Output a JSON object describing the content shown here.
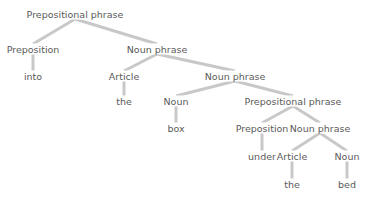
{
  "diagram": {
    "type": "parse-tree",
    "edge_color": "#c8c8c8",
    "text_color": "#5a5a5a",
    "nodes": [
      {
        "id": "pp1",
        "label": "Prepositional phrase",
        "x": 75,
        "y": 14,
        "kind": "phrase"
      },
      {
        "id": "prep1",
        "label": "Preposition",
        "x": 33,
        "y": 49,
        "kind": "category"
      },
      {
        "id": "into",
        "label": "into",
        "x": 33,
        "y": 76,
        "kind": "word"
      },
      {
        "id": "np1",
        "label": "Noun phrase",
        "x": 157,
        "y": 49,
        "kind": "phrase"
      },
      {
        "id": "art1",
        "label": "Article",
        "x": 124,
        "y": 76,
        "kind": "category"
      },
      {
        "id": "the1",
        "label": "the",
        "x": 124,
        "y": 101,
        "kind": "word"
      },
      {
        "id": "np2",
        "label": "Noun phrase",
        "x": 235,
        "y": 76,
        "kind": "phrase"
      },
      {
        "id": "noun1",
        "label": "Noun",
        "x": 176,
        "y": 101,
        "kind": "category"
      },
      {
        "id": "box",
        "label": "box",
        "x": 176,
        "y": 128,
        "kind": "word"
      },
      {
        "id": "pp2",
        "label": "Prepositional phrase",
        "x": 293,
        "y": 101,
        "kind": "phrase"
      },
      {
        "id": "prep2",
        "label": "Preposition",
        "x": 262,
        "y": 128,
        "kind": "category"
      },
      {
        "id": "under",
        "label": "under",
        "x": 262,
        "y": 156,
        "kind": "word"
      },
      {
        "id": "np3",
        "label": "Noun phrase",
        "x": 320,
        "y": 128,
        "kind": "phrase"
      },
      {
        "id": "art2",
        "label": "Article",
        "x": 292,
        "y": 156,
        "kind": "category"
      },
      {
        "id": "the2",
        "label": "the",
        "x": 292,
        "y": 184,
        "kind": "word"
      },
      {
        "id": "noun2",
        "label": "Noun",
        "x": 347,
        "y": 156,
        "kind": "category"
      },
      {
        "id": "bed",
        "label": "bed",
        "x": 347,
        "y": 184,
        "kind": "word"
      }
    ],
    "edges": [
      [
        "pp1",
        "prep1"
      ],
      [
        "pp1",
        "np1"
      ],
      [
        "prep1",
        "into"
      ],
      [
        "np1",
        "art1"
      ],
      [
        "np1",
        "np2"
      ],
      [
        "art1",
        "the1"
      ],
      [
        "np2",
        "noun1"
      ],
      [
        "np2",
        "pp2"
      ],
      [
        "noun1",
        "box"
      ],
      [
        "pp2",
        "prep2"
      ],
      [
        "pp2",
        "np3"
      ],
      [
        "prep2",
        "under"
      ],
      [
        "np3",
        "art2"
      ],
      [
        "np3",
        "noun2"
      ],
      [
        "art2",
        "the2"
      ],
      [
        "noun2",
        "bed"
      ]
    ]
  }
}
